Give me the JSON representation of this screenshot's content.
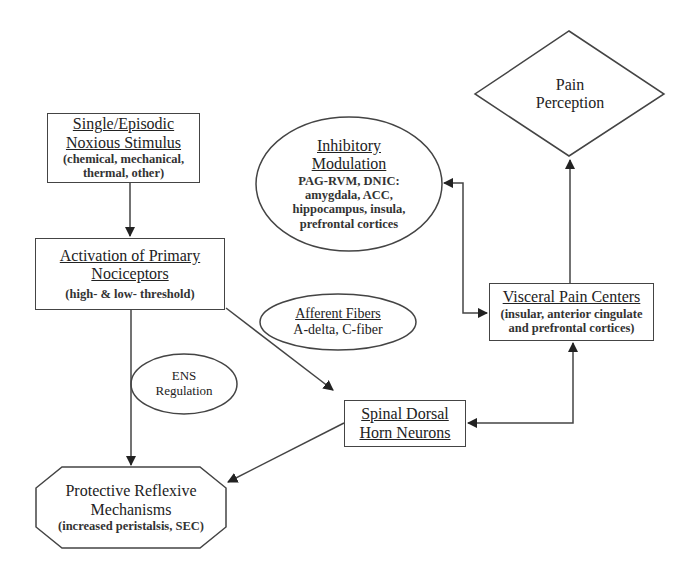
{
  "diagram": {
    "nodes": {
      "stimulus": {
        "title_line1": "Single/Episodic",
        "title_line2": "Noxious Stimulus",
        "sub_line1": "(chemical, mechanical,",
        "sub_line2": "thermal, other)"
      },
      "nociceptors": {
        "title_line1": "Activation of Primary",
        "title_line2": "Nociceptors",
        "sub_line1": "(high- & low- threshold)"
      },
      "inhibitory": {
        "title_line1": "Inhibitory",
        "title_line2": "Modulation",
        "sub_line1": "PAG-RVM, DNIC:",
        "sub_line2": "amygdala, ACC,",
        "sub_line3": "hippocampus, insula,",
        "sub_line4": "prefrontal cortices"
      },
      "pain_perception": {
        "line1": "Pain",
        "line2": "Perception"
      },
      "visceral": {
        "title_line1": "Visceral Pain Centers",
        "sub_line1": "(insular, anterior cingulate",
        "sub_line2": "and prefrontal cortices)"
      },
      "afferent": {
        "title_line1": "Afferent Fibers",
        "sub_line1": "A-delta, C-fiber"
      },
      "ens": {
        "line1": "ENS",
        "line2": "Regulation"
      },
      "spinal": {
        "title_line1": "Spinal Dorsal",
        "title_line2": "Horn Neurons"
      },
      "protective": {
        "line1": "Protective Reflexive",
        "line2": "Mechanisms",
        "sub_line1": "(increased peristalsis, SEC)"
      }
    },
    "edges": [
      {
        "from": "stimulus",
        "to": "nociceptors",
        "direction": "forward"
      },
      {
        "from": "nociceptors",
        "to": "spinal",
        "direction": "forward"
      },
      {
        "from": "nociceptors",
        "to": "protective",
        "direction": "forward"
      },
      {
        "from": "spinal",
        "to": "protective",
        "direction": "forward"
      },
      {
        "from": "spinal",
        "to": "visceral",
        "direction": "both"
      },
      {
        "from": "visceral",
        "to": "inhibitory",
        "direction": "both"
      },
      {
        "from": "visceral",
        "to": "pain_perception",
        "direction": "forward"
      }
    ],
    "colors": {
      "line": "#444444",
      "background": "#ffffff",
      "text": "#222222"
    }
  }
}
